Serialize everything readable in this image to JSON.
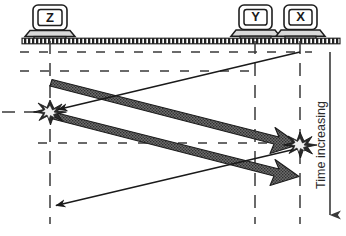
{
  "diagram": {
    "type": "space-time-collision-diagram",
    "bus": {
      "name": "shared-bus-cable",
      "y": 41,
      "x_start": 22,
      "x_end": 340,
      "color": "#2a2a2a"
    },
    "hosts": [
      {
        "id": "Z",
        "label": "Z",
        "x": 50,
        "icon": "computer-icon"
      },
      {
        "id": "Y",
        "label": "Y",
        "x": 255,
        "icon": "computer-icon"
      },
      {
        "id": "X",
        "label": "X",
        "x": 300,
        "icon": "computer-icon"
      }
    ],
    "timelines": [
      {
        "host": "Z",
        "x": 50,
        "y_start": 41,
        "y_end": 224
      },
      {
        "host": "Y",
        "x": 255,
        "y_start": 41,
        "y_end": 224
      },
      {
        "host": "X",
        "x": 300,
        "y_start": 41,
        "y_end": 224
      }
    ],
    "event_lines": [
      {
        "name": "event-line-send-start",
        "y": 52,
        "x_start": 20,
        "x_end": 312
      },
      {
        "name": "event-line-second",
        "y": 71,
        "x_start": 20,
        "x_end": 258
      },
      {
        "name": "event-line-collision-z",
        "y": 112,
        "x_start": 2,
        "x_end": 40
      },
      {
        "name": "event-line-collision-x",
        "y": 143,
        "x_start": 38,
        "x_end": 304
      }
    ],
    "signals": [
      {
        "name": "signal-x-to-z",
        "style": "thin",
        "from": {
          "x": 300,
          "y": 52
        },
        "to": {
          "x": 52,
          "y": 111
        },
        "arrow_at": "to"
      },
      {
        "name": "signal-z-to-x-upper",
        "style": "thick",
        "from": {
          "x": 52,
          "y": 82
        },
        "to": {
          "x": 296,
          "y": 144
        },
        "arrow_at": "to"
      },
      {
        "name": "signal-z-to-x-lower",
        "style": "thick",
        "from": {
          "x": 52,
          "y": 115
        },
        "to": {
          "x": 296,
          "y": 176
        },
        "arrow_at": "to"
      },
      {
        "name": "signal-x-to-z-lower",
        "style": "thin",
        "from": {
          "x": 300,
          "y": 148
        },
        "to": {
          "x": 50,
          "y": 207
        },
        "arrow_at": "to"
      }
    ],
    "collisions": [
      {
        "name": "collision-at-z",
        "x": 50,
        "y": 112
      },
      {
        "name": "collision-at-x",
        "x": 300,
        "y": 145
      }
    ],
    "time_axis": {
      "label": "Time increasing",
      "x": 330,
      "y_start": 52,
      "y_end": 228,
      "direction": "down"
    }
  }
}
